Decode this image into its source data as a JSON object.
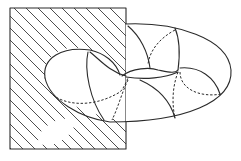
{
  "figure": {
    "colors": {
      "line": "#2a2a2a",
      "hatch": "#3a3a3a",
      "background": "#ffffff"
    },
    "plane": {
      "x": 10,
      "y": 8,
      "width": 116,
      "height": 141,
      "hatch_direction": "diagonal-down-right",
      "hatch_spacing": 12
    },
    "torus": {
      "outer_right_x": 231,
      "outer_top_y": 24,
      "outer_bottom_y": 122,
      "cross_section_left_x": 45
    }
  }
}
